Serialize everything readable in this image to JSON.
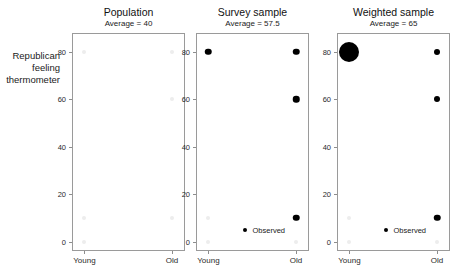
{
  "chart_data": {
    "type": "scatter",
    "title": "",
    "ylabel": "Republican\nfeeling\nthermometer",
    "xlabel": "",
    "ylim": [
      -4,
      88
    ],
    "yticks": [
      0,
      20,
      40,
      60,
      80
    ],
    "ytick_labels": [
      "0",
      "20",
      "40",
      "60",
      "80"
    ],
    "x_categories": [
      "Young",
      "Old"
    ],
    "grid": false,
    "legend_position": "bottom-center-right",
    "legend_label": "Observed",
    "panels": [
      {
        "title": "Population",
        "subtitle": "Average = 40",
        "average": 40,
        "legend_visible": false,
        "points": [
          {
            "x": "Young",
            "y": 80,
            "size": 4.0,
            "color": "#ededed",
            "observed": false
          },
          {
            "x": "Old",
            "y": 80,
            "size": 4.0,
            "color": "#ededed",
            "observed": false
          },
          {
            "x": "Old",
            "y": 60,
            "size": 4.0,
            "color": "#ededed",
            "observed": false
          },
          {
            "x": "Young",
            "y": 10,
            "size": 4.0,
            "color": "#ededed",
            "observed": false
          },
          {
            "x": "Old",
            "y": 10,
            "size": 4.0,
            "color": "#ededed",
            "observed": false
          },
          {
            "x": "Young",
            "y": 0,
            "size": 4.0,
            "color": "#ededed",
            "observed": false
          }
        ]
      },
      {
        "title": "Survey sample",
        "subtitle": "Average = 57.5",
        "average": 57.5,
        "legend_visible": true,
        "points": [
          {
            "x": "Young",
            "y": 80,
            "size": 6.5,
            "color": "#000000",
            "observed": true
          },
          {
            "x": "Old",
            "y": 80,
            "size": 6.5,
            "color": "#000000",
            "observed": true
          },
          {
            "x": "Old",
            "y": 60,
            "size": 6.5,
            "color": "#000000",
            "observed": true
          },
          {
            "x": "Old",
            "y": 10,
            "size": 6.5,
            "color": "#000000",
            "observed": true
          },
          {
            "x": "Young",
            "y": 10,
            "size": 4.0,
            "color": "#ededed",
            "observed": false
          },
          {
            "x": "Young",
            "y": 0,
            "size": 4.0,
            "color": "#ededed",
            "observed": false
          },
          {
            "x": "Old",
            "y": 0,
            "size": 4.0,
            "color": "#ededed",
            "observed": false
          }
        ]
      },
      {
        "title": "Weighted sample",
        "subtitle": "Average = 65",
        "average": 65,
        "legend_visible": true,
        "points": [
          {
            "x": "Young",
            "y": 80,
            "size": 20.0,
            "color": "#000000",
            "observed": true
          },
          {
            "x": "Old",
            "y": 80,
            "size": 6.0,
            "color": "#000000",
            "observed": true
          },
          {
            "x": "Old",
            "y": 60,
            "size": 6.0,
            "color": "#000000",
            "observed": true
          },
          {
            "x": "Old",
            "y": 10,
            "size": 6.5,
            "color": "#000000",
            "observed": true
          },
          {
            "x": "Young",
            "y": 10,
            "size": 4.0,
            "color": "#ededed",
            "observed": false
          },
          {
            "x": "Young",
            "y": 0,
            "size": 4.0,
            "color": "#ededed",
            "observed": false
          },
          {
            "x": "Old",
            "y": 0,
            "size": 4.0,
            "color": "#ededed",
            "observed": false
          }
        ]
      }
    ]
  }
}
